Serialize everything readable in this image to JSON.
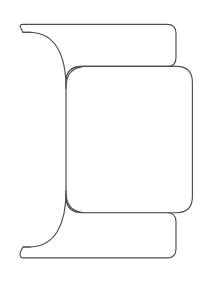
{
  "document": {
    "type": "technical-line-drawing",
    "title": "",
    "caption": "",
    "background_color": "#ffffff",
    "stroke_color": "#4d4d4d",
    "fill_color": "#ffffff",
    "stroke_width": 1.15,
    "canvas": {
      "width": 219,
      "height": 285
    }
  },
  "figure": {
    "name": "bracket-profile-outline",
    "parts": [
      {
        "name": "upper-bar",
        "label": "Upper flange",
        "x": 20,
        "y": 24,
        "width": 156,
        "height": 42,
        "corner_radius": 9
      },
      {
        "name": "center-body",
        "label": "Central web",
        "x": 65,
        "y": 66,
        "width": 127,
        "height": 147,
        "corner_radius": 16
      },
      {
        "name": "lower-bar",
        "label": "Lower flange",
        "x": 20,
        "y": 213,
        "width": 156,
        "height": 45,
        "corner_radius": 9
      },
      {
        "name": "upper-left-fillet",
        "label": "Upper concave fillet",
        "radius": 46
      },
      {
        "name": "lower-left-fillet",
        "label": "Lower concave fillet",
        "radius": 46
      },
      {
        "name": "upper-left-tip",
        "label": "Upper left hooked tip",
        "x": 20,
        "y": 24
      },
      {
        "name": "lower-left-tip",
        "label": "Lower left hooked tip",
        "x": 20,
        "y": 258
      }
    ],
    "geometry": {
      "outline_d": "M 30.5 24 L 167 24 Q 176 24 176 33 L 176 57.5 Q 176 66.5 167 66.5 L 81.5 66.5 Q 65.5 66.5 65.5 82.5 L 65.5 196.5 Q 65.5 212.8 81.5 212.8 L 167 212.8 Q 176 212.8 176 221.8 L 176 249 Q 176 258 167 258 L 30.5 258 L 21.5 258 Q 19.6 256.6 20.6 254.6 L 23.4 249.6 L 31 249.6 Q 66.6 247.2 65.5 196.5 L 65.5 212.8 Q 65.5 212.8 65.5 212.8 L 65.5 82.5 Q 65.5 82.5 65.5 82.5 L 65.5 86.5 Q 66.6 35 31 32.6 L 23.4 32.6 L 20.6 27.6 Q 19.6 25.6 21.5 24 Z",
      "outer_d": "M 30.5 24 L 167 24 Q 176 24 176 33 L 176 57.5 Q 176 66.5 167 66.5 L 81.5 66.5 Q 65.5 66.5 65.5 82.5 L 65.5 196.5 Q 65.5 212.8 81.5 212.8 L 167 212.8 Q 176 212.8 176 221.8 L 176 249 Q 176 258 167 258 L 23 258 Q 19.5 258 20 255.5 L 22.6 250 L 30.5 250 Q 64 247 65.5 196.5",
      "body_right_d": "M 81.5 66.5 L 176 66.5 Q 192 66.5 192 82.5 L 192 196.5 Q 192 212.8 176 212.8 L 81.5 212.8",
      "upper_fillet_d": "M 65.5 86 C 65.5 55 55 34 30.5 32.6 L 22.6 32.6 L 20 27 Q 19.5 24.4 23 24.4 L 30.5 24.4",
      "lower_fillet_d": "M 65.5 193 C 65.5 224 55 245.4 30.5 246.6 L 22.6 246.6 L 20 252.4 Q 19.5 255 23 255 L 30.5 255"
    }
  },
  "labels": {
    "none_visible": ""
  }
}
